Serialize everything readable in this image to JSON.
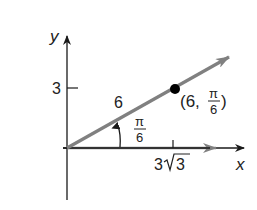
{
  "diagram": {
    "type": "polar-to-rectangular",
    "axes": {
      "x_label": "x",
      "y_label": "y",
      "y_tick_label": "3",
      "x_tick_label_prefix": "3",
      "x_tick_label_radical": "3"
    },
    "ray": {
      "length_label": "6",
      "angle_label_num": "π",
      "angle_label_den": "6"
    },
    "point": {
      "label_open": "(6, ",
      "label_num": "π",
      "label_den": "6",
      "label_close": ")"
    },
    "colors": {
      "axis": "#1a1a1a",
      "ray": "#808080",
      "point": "#000000",
      "text": "#222222"
    }
  }
}
